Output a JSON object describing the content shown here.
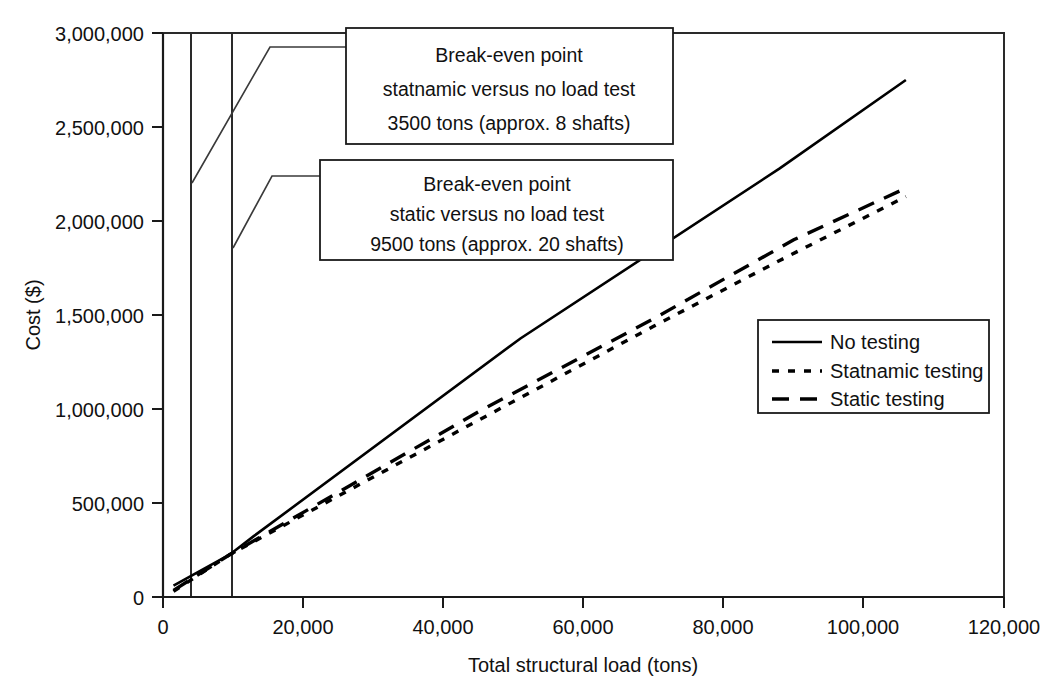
{
  "chart_data": {
    "type": "line",
    "title": "",
    "xlabel": "Total structural load (tons)",
    "ylabel": "Cost ($)",
    "xlim": [
      0,
      120000
    ],
    "ylim": [
      0,
      3000000
    ],
    "xticks": [
      "0",
      "20,000",
      "40,000",
      "60,000",
      "80,000",
      "100,000",
      "120,000"
    ],
    "xtick_values": [
      0,
      20000,
      40000,
      60000,
      80000,
      100000,
      120000
    ],
    "yticks": [
      "0",
      "500,000",
      "1,000,000",
      "1,500,000",
      "2,000,000",
      "2,500,000",
      "3,000,000"
    ],
    "ytick_values": [
      0,
      500000,
      1000000,
      1500000,
      2000000,
      2500000,
      3000000
    ],
    "grid": false,
    "legend_position": "center-right",
    "series": [
      {
        "name": "No testing",
        "style": "solid",
        "x": [
          1500,
          9500,
          13000,
          51000,
          88000,
          106000
        ],
        "y": [
          60000,
          225000,
          325000,
          1375000,
          2280000,
          2750000
        ]
      },
      {
        "name": "Statnamic testing",
        "style": "dotted",
        "x": [
          1500,
          9500,
          45000,
          70000,
          88000,
          106000
        ],
        "y": [
          30000,
          225000,
          940000,
          1440000,
          1790000,
          2130000
        ]
      },
      {
        "name": "Static testing",
        "style": "dashed",
        "x": [
          1500,
          9500,
          45000,
          70000,
          90000,
          106000
        ],
        "y": [
          35000,
          225000,
          985000,
          1480000,
          1900000,
          2175000
        ]
      }
    ],
    "reference_lines": [
      {
        "name": "statnamic-breakeven",
        "x": 3500
      },
      {
        "name": "static-breakeven",
        "x": 9500
      }
    ],
    "annotations": [
      {
        "name": "statnamic-breakeven-callout",
        "lines": [
          "Break-even point",
          "statnamic versus no load test",
          "3500 tons (approx. 8 shafts)"
        ]
      },
      {
        "name": "static-breakeven-callout",
        "lines": [
          "Break-even point",
          "static versus no load test",
          "9500 tons (approx. 20 shafts)"
        ]
      }
    ],
    "legend": [
      {
        "label": "No testing",
        "style": "solid"
      },
      {
        "label": "Statnamic testing",
        "style": "dotted"
      },
      {
        "label": "Static testing",
        "style": "dashed"
      }
    ],
    "colors": {
      "line": "#000000",
      "axis": "#1a1a1a",
      "background": "#ffffff"
    }
  }
}
